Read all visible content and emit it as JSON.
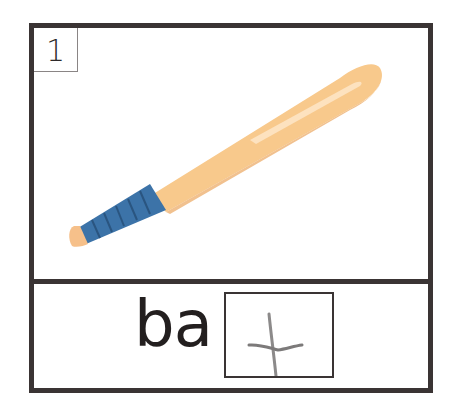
{
  "card": {
    "number": "1",
    "picture": {
      "subject": "baseball-bat",
      "colors": {
        "barrel": "#f8c98c",
        "barrel_shadow": "#eeb273",
        "highlight": "#fde4c4",
        "grip": "#3c73a8",
        "grip_dark": "#2a5580",
        "knob": "#f6c08a"
      }
    },
    "word": {
      "prefix": "ba",
      "answer_handwritten": "t",
      "full_word": "bat"
    },
    "colors": {
      "border": "#3a3434",
      "text": "#231f1f",
      "handwriting": "#8c8a8a"
    }
  }
}
